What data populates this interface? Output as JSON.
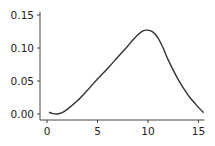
{
  "chart_data": {
    "type": "line",
    "title": "",
    "xlabel": "",
    "ylabel": "",
    "xlim": [
      -0.3,
      15.6
    ],
    "ylim": [
      -0.005,
      0.155
    ],
    "xticks": [
      0,
      5,
      10,
      15
    ],
    "xtick_labels": [
      "0",
      "5",
      "10",
      "15"
    ],
    "yticks": [
      0.0,
      0.05,
      0.1,
      0.15
    ],
    "ytick_labels": [
      "0.00",
      "0.05",
      "0.10",
      "0.15"
    ],
    "grid": false,
    "legend": null,
    "series": [
      {
        "name": "density",
        "color": "#333333",
        "x": [
          0.2,
          0.5,
          1.0,
          1.5,
          2.0,
          3.0,
          4.0,
          5.0,
          6.0,
          7.0,
          8.0,
          8.5,
          9.0,
          9.5,
          10.0,
          10.5,
          11.0,
          11.5,
          12.0,
          13.0,
          14.0,
          15.0,
          15.5
        ],
        "y": [
          0.003,
          0.001,
          0.0,
          0.002,
          0.007,
          0.02,
          0.036,
          0.053,
          0.069,
          0.086,
          0.103,
          0.112,
          0.12,
          0.126,
          0.127,
          0.124,
          0.115,
          0.1,
          0.082,
          0.052,
          0.028,
          0.01,
          0.002
        ]
      }
    ]
  }
}
